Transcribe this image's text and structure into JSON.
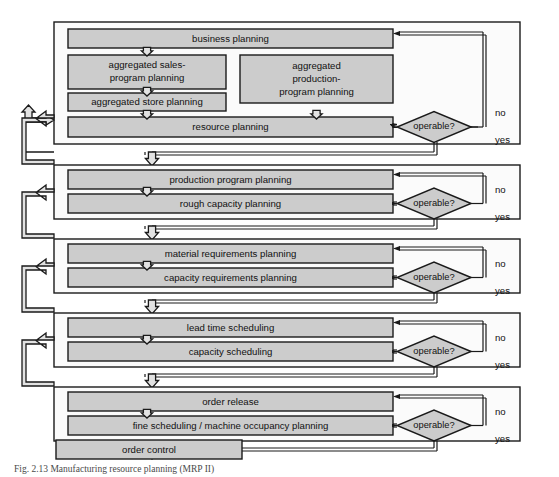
{
  "figure": {
    "caption": "Fig. 2.13   Manufacturing resource planning (MRP II)",
    "colors": {
      "box_fill": "#cccccc",
      "frame_fill": "#fbfbfb",
      "arrow_fill": "#e2e2e2",
      "stroke": "#1a1a1a",
      "page_background": "#ffffff"
    }
  },
  "stages": [
    {
      "id": "stage-business-planning",
      "decision": "operable?",
      "branch_no": "no",
      "branch_yes": "yes",
      "boxes": [
        {
          "id": "business-planning",
          "label": "business planning"
        },
        {
          "id": "aggregated-sales-program-planning",
          "label": "aggregated sales-\nprogram planning",
          "line1": "aggregated sales-",
          "line2": "program planning"
        },
        {
          "id": "aggregated-production-program-planning",
          "label": "aggregated production-program planning",
          "line1": "aggregated",
          "line2": "production-",
          "line3": "program planning"
        },
        {
          "id": "aggregated-store-planning",
          "label": "aggregated store planning"
        },
        {
          "id": "resource-planning",
          "label": "resource planning"
        }
      ]
    },
    {
      "id": "stage-production-program",
      "decision": "operable?",
      "branch_no": "no",
      "branch_yes": "yes",
      "boxes": [
        {
          "id": "production-program-planning",
          "label": "production program planning"
        },
        {
          "id": "rough-capacity-planning",
          "label": "rough capacity planning"
        }
      ]
    },
    {
      "id": "stage-requirements",
      "decision": "operable?",
      "branch_no": "no",
      "branch_yes": "yes",
      "boxes": [
        {
          "id": "material-requirements-planning",
          "label": "material requirements planning"
        },
        {
          "id": "capacity-requirements-planning",
          "label": "capacity requirements planning"
        }
      ]
    },
    {
      "id": "stage-scheduling",
      "decision": "operable?",
      "branch_no": "no",
      "branch_yes": "yes",
      "boxes": [
        {
          "id": "lead-time-scheduling",
          "label": "lead time scheduling"
        },
        {
          "id": "capacity-scheduling",
          "label": "capacity scheduling"
        }
      ]
    },
    {
      "id": "stage-order-release",
      "decision": "operable?",
      "branch_no": "no",
      "branch_yes": "yes",
      "boxes": [
        {
          "id": "order-release",
          "label": "order release"
        },
        {
          "id": "fine-scheduling-machine-occupancy-planning",
          "label": "fine scheduling / machine occupancy planning"
        }
      ]
    }
  ],
  "terminal": {
    "id": "order-control",
    "label": "order control"
  }
}
